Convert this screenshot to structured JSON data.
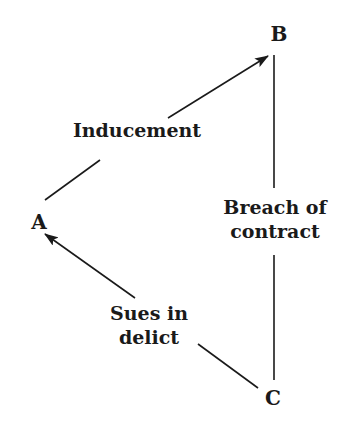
{
  "diagram": {
    "type": "triangle-relationship",
    "line_color": "#1a1a1a",
    "background": "#ffffff",
    "nodes": {
      "A": {
        "label": "A",
        "x": 39,
        "y": 222
      },
      "B": {
        "label": "B",
        "x": 279,
        "y": 34
      },
      "C": {
        "label": "C",
        "x": 273,
        "y": 398
      }
    },
    "edges": {
      "a_b": {
        "from": "A",
        "to": "B",
        "arrow": "to-B",
        "label": "Inducement"
      },
      "b_c": {
        "from": "B",
        "to": "C",
        "arrow": "none",
        "label_line1": "Breach of",
        "label_line2": "contract"
      },
      "c_a": {
        "from": "C",
        "to": "A",
        "arrow": "to-A",
        "label_line1": "Sues in",
        "label_line2": "delict"
      }
    }
  }
}
